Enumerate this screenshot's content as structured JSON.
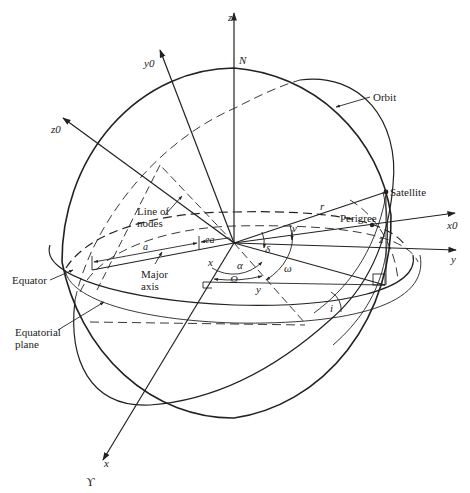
{
  "figure": {
    "type": "orbital-geometry-diagram",
    "axes": {
      "z": "z",
      "y0": "y0",
      "z0": "z0",
      "x0": "x0",
      "y": "y",
      "x": "x"
    },
    "symbols": {
      "north": "N",
      "vernal_equinox": "ϒ",
      "radius": "r",
      "true_anomaly": "ν",
      "declination": "δ",
      "right_ascension": "α",
      "raan": "Ω",
      "arg_perigee": "ω",
      "inclination": "i",
      "semi_major": "a",
      "ea": "ea",
      "x_comp": "x",
      "y_comp": "y",
      "z_comp": "z"
    },
    "labels": {
      "orbit": "Orbit",
      "satellite": "Satellite",
      "perigee": "Perigree",
      "line_of_nodes_1": "Line of",
      "line_of_nodes_2": "nodes",
      "major_axis_1": "Major",
      "major_axis_2": "axis",
      "equator": "Equator",
      "equatorial_plane_1": "Equatorial",
      "equatorial_plane_2": "plane"
    }
  }
}
